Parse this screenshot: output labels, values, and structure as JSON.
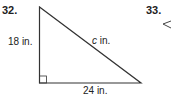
{
  "problems": [
    {
      "number": "32.",
      "legs": {
        "vertical": "18 in.",
        "horizontal": "24 in."
      },
      "hypotenuse": {
        "var": "c",
        "unit": " in."
      }
    },
    {
      "number": "33."
    }
  ]
}
